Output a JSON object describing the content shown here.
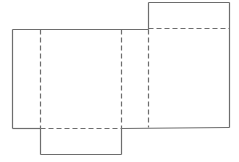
{
  "diagram": {
    "title": "",
    "type": "box net (unfolded rectangular box)",
    "stroke_color": "#6e6e6e",
    "background": "#ffffff",
    "solid_edges": [
      {
        "id": "main-top",
        "x1": 12,
        "y1": 29,
        "x2": 148,
        "y2": 29
      },
      {
        "id": "main-left",
        "x1": 12,
        "y1": 29,
        "x2": 12,
        "y2": 128
      },
      {
        "id": "main-bottom-left",
        "x1": 12,
        "y1": 128,
        "x2": 40,
        "y2": 128
      },
      {
        "id": "main-bottom-right",
        "x1": 121,
        "y1": 128,
        "x2": 229,
        "y2": 127
      },
      {
        "id": "right-panel-top-flap-left",
        "x1": 148,
        "y1": 2,
        "x2": 148,
        "y2": 29
      },
      {
        "id": "right-panel-top",
        "x1": 148,
        "y1": 2,
        "x2": 229,
        "y2": 2
      },
      {
        "id": "right-panel-right",
        "x1": 229,
        "y1": 2,
        "x2": 229,
        "y2": 127
      },
      {
        "id": "bottom-flap-left",
        "x1": 40,
        "y1": 128,
        "x2": 40,
        "y2": 154
      },
      {
        "id": "bottom-flap-bottom",
        "x1": 40,
        "y1": 154,
        "x2": 121,
        "y2": 154
      },
      {
        "id": "bottom-flap-right",
        "x1": 121,
        "y1": 128,
        "x2": 121,
        "y2": 154
      }
    ],
    "fold_lines": [
      {
        "id": "fold-left-vertical",
        "x1": 40,
        "y1": 29,
        "x2": 40,
        "y2": 128
      },
      {
        "id": "fold-middle-vertical",
        "x1": 121,
        "y1": 29,
        "x2": 121,
        "y2": 128
      },
      {
        "id": "fold-right-vertical",
        "x1": 148,
        "y1": 29,
        "x2": 148,
        "y2": 127
      },
      {
        "id": "fold-top-flap",
        "x1": 148,
        "y1": 28,
        "x2": 229,
        "y2": 28
      },
      {
        "id": "fold-bottom-flap",
        "x1": 40,
        "y1": 128,
        "x2": 121,
        "y2": 128
      }
    ]
  }
}
